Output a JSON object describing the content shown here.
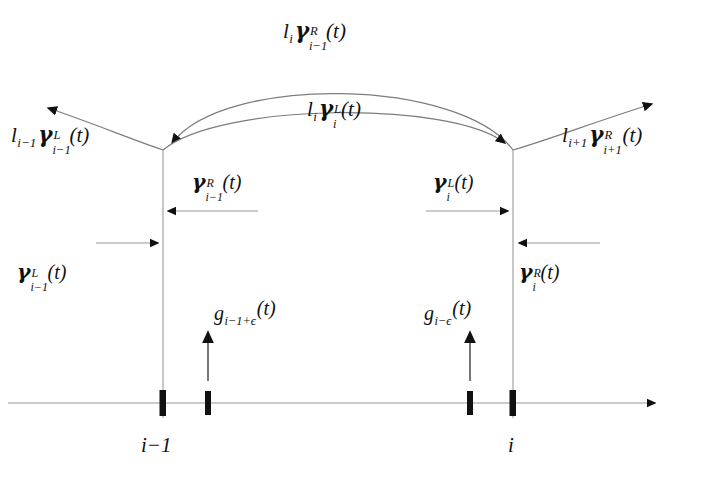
{
  "figure": {
    "type": "mathematical-diagram",
    "background_color": "#ffffff",
    "ink_color": "#111111",
    "line_color": "#8a8a8a"
  },
  "axis": {
    "name": "horizontal-number-line",
    "y": 403,
    "x_start": 8,
    "x_end": 668,
    "arrow_direction": "right",
    "tick_labels": [
      {
        "id": "tick-i-minus-1",
        "text": "i−1",
        "x": 163
      },
      {
        "id": "tick-i",
        "text": "i",
        "x": 513
      }
    ],
    "tick_marks_x": [
      163,
      208,
      470,
      513
    ]
  },
  "verticals": [
    {
      "id": "vertical-left",
      "x": 163,
      "y_top": 150,
      "y_bottom": 418
    },
    {
      "id": "vertical-right",
      "x": 513,
      "y_top": 150,
      "y_bottom": 418
    }
  ],
  "curve_labels": {
    "outer_arc": {
      "id": "label-l-i-gamma-R-i-minus-1",
      "lead": "l",
      "lead_sub": "i",
      "sym": "γ",
      "sup": "R",
      "sub": "i−1",
      "arg": "(t)",
      "full": "lᵢ γᴿᵢ₋₁(t)"
    },
    "inner_arc": {
      "id": "label-l-i-gamma-L-i",
      "lead": "l",
      "lead_sub": "i",
      "sym": "γ",
      "sup": "L",
      "sub": "i",
      "arg": "(t)",
      "full": "lᵢ γᴸᵢ(t)"
    },
    "left_outward": {
      "id": "label-l-i-minus-1-gamma-L-i-minus-1",
      "lead": "l",
      "lead_sub": "i−1",
      "sym": "γ",
      "sup": "L",
      "sub": "i−1",
      "arg": "(t)",
      "full": "lᵢ₋₁ γᴸᵢ₋₁(t)"
    },
    "right_outward": {
      "id": "label-l-i-plus-1-gamma-R-i-plus-1",
      "lead": "l",
      "lead_sub": "i+1",
      "sym": "γ",
      "sup": "R",
      "sub": "i+1",
      "arg": "(t)",
      "full": "lᵢ₊₁ γᴿᵢ₊₁(t)"
    }
  },
  "dimension_labels": {
    "inner_left": {
      "id": "label-gamma-R-i-minus-1",
      "sym": "γ",
      "sup": "R",
      "sub": "i−1",
      "arg": "(t)",
      "full": "γᴿᵢ₋₁(t)"
    },
    "inner_right": {
      "id": "label-gamma-L-i",
      "sym": "γ",
      "sup": "L",
      "sub": "i",
      "arg": "(t)",
      "full": "γᴸᵢ(t)"
    },
    "outer_left": {
      "id": "label-gamma-L-i-minus-1",
      "sym": "γ",
      "sup": "L",
      "sub": "i−1",
      "arg": "(t)",
      "full": "γᴸᵢ₋₁(t)"
    },
    "outer_right": {
      "id": "label-gamma-R-i",
      "sym": "γ",
      "sup": "R",
      "sub": "i",
      "arg": "(t)",
      "full": "γᴿᵢ(t)"
    }
  },
  "g_labels": {
    "left": {
      "id": "label-g-i-minus-1-plus-epsilon",
      "sym": "g",
      "sub": "i−1+ϵ",
      "arg": "(t)",
      "full": "gᵢ₋₁₊ϵ(t)",
      "arrow_x": 208,
      "arrow_direction": "up"
    },
    "right": {
      "id": "label-g-i-minus-epsilon",
      "sym": "g",
      "sub": "i−ϵ",
      "arg": "(t)",
      "full": "gᵢ₋ϵ(t)",
      "arrow_x": 470,
      "arrow_direction": "up"
    }
  }
}
